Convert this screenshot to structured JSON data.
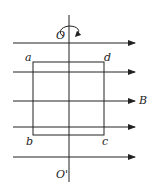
{
  "diagram": {
    "type": "physics-rotating-coil-in-magnetic-field",
    "colors": {
      "stroke": "#222222",
      "background": "#ffffff"
    },
    "axis": {
      "top_label": "O",
      "bottom_label": "O'",
      "x": 69,
      "y_top": 15,
      "y_bottom": 182,
      "rotation_indicator": "rotation-arrow"
    },
    "field": {
      "label": "B",
      "direction": "right",
      "lines_y": [
        43,
        72,
        101,
        127,
        157
      ],
      "x_start": 13,
      "x_end": 135
    },
    "coil": {
      "corners": [
        {
          "label": "a",
          "x": 33,
          "y": 62
        },
        {
          "label": "d",
          "x": 104,
          "y": 62
        },
        {
          "label": "c",
          "x": 104,
          "y": 135
        },
        {
          "label": "b",
          "x": 33,
          "y": 135
        }
      ]
    }
  }
}
